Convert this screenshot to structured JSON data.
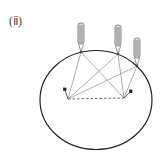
{
  "figure": {
    "label": "(ⅱ)",
    "ellipse": {
      "cx": 96,
      "cy": 100,
      "rx": 56,
      "ry": 49.5,
      "stroke": "#222222"
    },
    "probes": [
      {
        "id": "left",
        "x": 81,
        "top": 23,
        "tip_y": 52
      },
      {
        "id": "middle",
        "x": 118,
        "top": 25,
        "tip_y": 54
      },
      {
        "id": "right",
        "x": 137,
        "top": 38,
        "tip_y": 66
      }
    ],
    "base_points": [
      {
        "id": "left",
        "x": 68,
        "y": 99
      },
      {
        "id": "right",
        "x": 124,
        "y": 98
      }
    ],
    "markers": [
      {
        "id": "left",
        "x": 65,
        "y": 89
      },
      {
        "id": "right",
        "x": 130,
        "y": 91
      }
    ],
    "colors": {
      "line": "#888888",
      "outline": "#222222",
      "probe_fill": "#dddddd"
    }
  }
}
